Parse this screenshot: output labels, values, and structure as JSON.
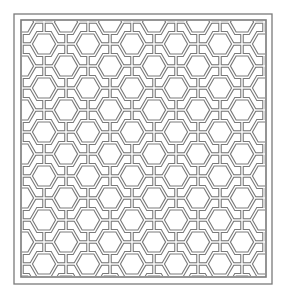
{
  "image": {
    "subject": "geometric-tiling-pattern",
    "description": "Square panel of interlaced hexagons and pentagons drawn in double strapwork lines inside a double rectangular frame",
    "colors": {
      "background": "#ffffff",
      "line": "#7a7a7a",
      "strap_fill": "#ffffff"
    },
    "frame": {
      "outer": {
        "x": 14,
        "y": 14,
        "width": 258,
        "height": 270
      },
      "inner": {
        "x": 21,
        "y": 20,
        "width": 245,
        "height": 257
      }
    },
    "tile_period": 44,
    "hex_radius": 13
  }
}
